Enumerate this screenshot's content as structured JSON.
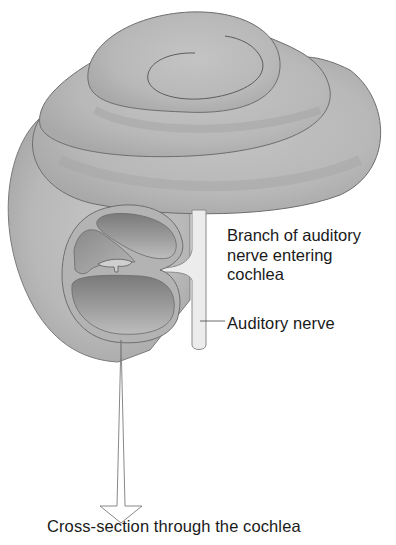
{
  "diagram": {
    "colors": {
      "cochlea_fill": "#bdbdbd",
      "cochlea_shade": "#a8a8a8",
      "outline": "#6e6e6e",
      "duct_fill": "#8c8c8c",
      "duct_light": "#c9c9c9",
      "nerve_fill": "#ececec",
      "text": "#1a1a1a",
      "background": "#ffffff"
    },
    "labels": {
      "branch_line1": "Branch of auditory",
      "branch_line2": "nerve entering",
      "branch_line3": "cochlea",
      "auditory_nerve": "Auditory nerve",
      "caption": "Cross-section through the cochlea"
    }
  }
}
